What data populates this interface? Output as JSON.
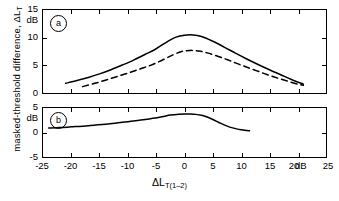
{
  "figure": {
    "background": "#ffffff",
    "line_color": "#000000",
    "axis_label_y": "masked-threshold difference, ",
    "axis_label_y_symbol": "ΔL",
    "axis_label_y_sub": "T",
    "axis_label_x_symbol": "ΔL",
    "axis_label_x_sub": "T(1–2)",
    "x_unit": "dB",
    "panel_a_letter": "a",
    "panel_b_letter": "b"
  },
  "chart_data": {
    "type": "line",
    "title": "",
    "xlabel": "ΔL_T(1-2)",
    "ylabel": "masked-threshold difference, ΔL_T",
    "x_unit": "dB",
    "y_unit": "dB",
    "xlim": [
      -25,
      25
    ],
    "xticks": [
      -25,
      -20,
      -15,
      -10,
      -5,
      0,
      5,
      10,
      15,
      20,
      25
    ],
    "xticklabels": [
      "-25",
      "-20",
      "-15",
      "-10",
      "-5",
      "0",
      "5",
      "10",
      "15",
      "20",
      "25"
    ],
    "grid": false,
    "legend": false,
    "panels": [
      {
        "id": "a",
        "label": "a",
        "ylim": [
          0,
          15
        ],
        "yticks": [
          0,
          5,
          10,
          15
        ],
        "yticklabels": [
          "0",
          "5",
          "10",
          "15"
        ],
        "y_unit": "dB",
        "series": [
          {
            "name": "solid",
            "style": "solid",
            "x": [
              -21.0,
              -19.0,
              -17.0,
              -15.0,
              -13.0,
              -11.0,
              -9.0,
              -7.0,
              -5.0,
              -3.0,
              -1.5,
              0.0,
              1.5,
              3.0,
              5.0,
              7.0,
              9.0,
              11.0,
              13.0,
              15.0,
              17.0,
              19.0,
              21.0
            ],
            "y": [
              1.75,
              2.25,
              2.8,
              3.45,
              4.2,
              5.05,
              5.95,
              6.95,
              8.0,
              9.3,
              10.1,
              10.45,
              10.5,
              10.2,
              9.35,
              8.3,
              7.2,
              6.15,
              5.15,
              4.2,
              3.3,
              2.4,
              1.6
            ]
          },
          {
            "name": "dashed",
            "style": "dashed",
            "x": [
              -18.0,
              -16.0,
              -14.0,
              -12.0,
              -10.0,
              -8.0,
              -6.0,
              -4.0,
              -2.0,
              -0.5,
              1.0,
              2.5,
              4.0,
              6.0,
              8.0,
              10.0,
              12.0,
              14.0,
              16.0,
              18.0,
              20.0,
              21.0
            ],
            "y": [
              1.15,
              1.7,
              2.3,
              2.95,
              3.6,
              4.3,
              5.0,
              5.9,
              6.9,
              7.5,
              7.7,
              7.6,
              7.25,
              6.6,
              5.85,
              5.05,
              4.3,
              3.55,
              2.85,
              2.2,
              1.6,
              1.4
            ]
          }
        ]
      },
      {
        "id": "b",
        "label": "b",
        "ylim": [
          -5,
          5
        ],
        "yticks": [
          -5,
          0,
          5
        ],
        "yticklabels": [
          "-5",
          "0",
          "5"
        ],
        "y_unit": "dB",
        "series": [
          {
            "name": "solid",
            "style": "solid",
            "x": [
              -24.0,
              -22.0,
              -20.0,
              -18.0,
              -16.0,
              -14.0,
              -12.0,
              -10.0,
              -8.0,
              -6.0,
              -4.0,
              -2.5,
              -1.0,
              0.0,
              1.0,
              2.0,
              3.0,
              4.0,
              5.0,
              6.0,
              7.0,
              8.0,
              9.0,
              10.0,
              11.0,
              11.5
            ],
            "y": [
              0.9,
              1.0,
              1.15,
              1.3,
              1.5,
              1.7,
              1.95,
              2.2,
              2.5,
              2.8,
              3.2,
              3.55,
              3.75,
              3.8,
              3.78,
              3.7,
              3.5,
              3.15,
              2.65,
              2.1,
              1.55,
              1.1,
              0.8,
              0.55,
              0.4,
              0.35
            ]
          }
        ]
      }
    ]
  }
}
